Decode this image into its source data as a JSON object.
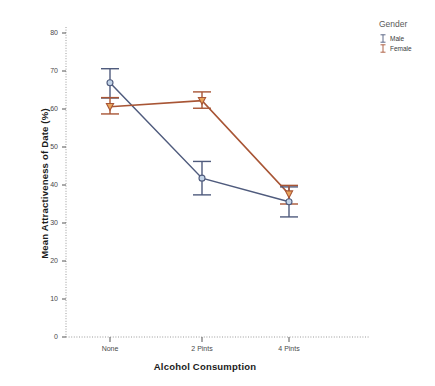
{
  "chart_data": {
    "type": "line",
    "title": "",
    "subtitle": "",
    "xlabel": "Alcohol Consumption",
    "ylabel": "Mean Attractiveness of Date (%)",
    "categories": [
      "None",
      "2 Pints",
      "4 Pints"
    ],
    "ylim": [
      0,
      80
    ],
    "y_ticks": [
      0,
      10,
      20,
      30,
      40,
      50,
      60,
      70,
      80
    ],
    "y_tick_labels": [
      "0",
      "10",
      "20",
      "30",
      "40",
      "50",
      "60",
      "70",
      "80"
    ],
    "grid": false,
    "legend_position": "right",
    "legend_title": "Gender",
    "error_bar_type": "95% CI",
    "series": [
      {
        "name": "Male",
        "color": "#4f5b7d",
        "marker": "circle",
        "marker_fill": "#c3d4e8",
        "values": [
          66.9,
          41.8,
          35.6
        ],
        "error_low": [
          62.9,
          37.4,
          31.6
        ],
        "error_high": [
          70.6,
          46.2,
          39.5
        ]
      },
      {
        "name": "Female",
        "color": "#a85535",
        "marker": "triangle-down",
        "marker_fill": "#e8a55c",
        "values": [
          60.6,
          62.2,
          37.6
        ],
        "error_low": [
          58.7,
          60.2,
          35.0
        ],
        "error_high": [
          63.0,
          64.5,
          39.9
        ]
      }
    ]
  },
  "axes": {
    "y_title": "Mean Attractiveness of Date (%)",
    "x_title": "Alcohol Consumption"
  },
  "legend": {
    "title": "Gender",
    "items": [
      {
        "label": "Male",
        "color": "#4f5b7d",
        "glyph": "error-bar-glyph"
      },
      {
        "label": "Female",
        "color": "#a85535",
        "glyph": "error-bar-glyph"
      }
    ]
  }
}
